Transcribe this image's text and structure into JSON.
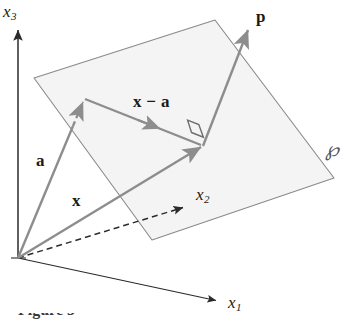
{
  "figure": {
    "type": "vector-geometry-diagram",
    "background_color": "#ffffff"
  },
  "colors": {
    "plane_fill": "#f4f4f4",
    "plane_stroke": "#8a8a8a",
    "vector_stroke": "#8d8d8d",
    "axis_stroke": "#2b2b2b",
    "label_text": "#1a1a1a",
    "plane_label_text": "#555555"
  },
  "axes": [
    {
      "id": "x3",
      "name": "x3-axis",
      "label": "x",
      "subscript": "3",
      "style": "solid",
      "from": [
        18,
        258
      ],
      "to": [
        18,
        30
      ],
      "label_pos": [
        4,
        4
      ]
    },
    {
      "id": "x1",
      "name": "x1-axis",
      "label": "x",
      "subscript": "1",
      "style": "solid",
      "from": [
        18,
        258
      ],
      "to": [
        218,
        301
      ],
      "label_pos": [
        228,
        296
      ]
    },
    {
      "id": "x2",
      "name": "x2-axis",
      "label": "x",
      "subscript": "2",
      "style": "dashed",
      "from": [
        18,
        258
      ],
      "to": [
        185,
        207
      ],
      "label_pos": [
        196,
        187
      ]
    }
  ],
  "origin": [
    18,
    258
  ],
  "plane": {
    "name": "plane-P",
    "label": "℘",
    "label_pos": [
      326,
      140
    ],
    "vertices": [
      [
        34,
        78
      ],
      [
        215,
        20
      ],
      [
        334,
        178
      ],
      [
        152,
        240
      ]
    ]
  },
  "vectors": [
    {
      "id": "a",
      "name": "vector-a",
      "label": "a",
      "from": [
        18,
        258
      ],
      "to": [
        84,
        100
      ],
      "dash_from": [
        72,
        128
      ],
      "label_pos": [
        36,
        152
      ],
      "arrow_at": "tip"
    },
    {
      "id": "x",
      "name": "vector-x",
      "label": "x",
      "from": [
        18,
        258
      ],
      "to": [
        203,
        146
      ],
      "label_pos": [
        72,
        192
      ],
      "arrow_at": "tip"
    },
    {
      "id": "x-minus-a",
      "name": "vector-x-minus-a",
      "label": "x − a",
      "from": [
        85,
        99
      ],
      "to": [
        203,
        146
      ],
      "label_pos": [
        134,
        94
      ],
      "arrow_at": "mid"
    },
    {
      "id": "p",
      "name": "vector-p",
      "label": "p",
      "from": [
        203,
        146
      ],
      "to": [
        249,
        27
      ],
      "label_pos": [
        257,
        10
      ],
      "arrow_at": "tip"
    }
  ],
  "right_angle": {
    "name": "right-angle-marker",
    "corner": [
      203,
      146
    ],
    "size": 13
  },
  "caption": {
    "text": "Figure 3",
    "visible": "cropped"
  }
}
